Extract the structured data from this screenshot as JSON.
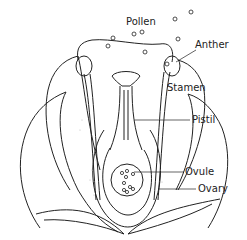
{
  "labels": {
    "pollen": "Pollen",
    "anther": "Anther",
    "stamen": "Stamen",
    "pistil": "Pistil",
    "ovule": "Ovule",
    "ovary": "Ovary"
  },
  "colors": {
    "ink": "#222222",
    "background": "#ffffff",
    "stipple": "#bbbbbb"
  }
}
